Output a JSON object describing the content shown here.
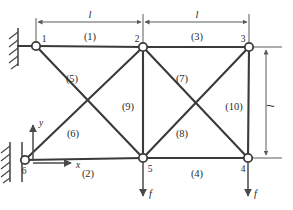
{
  "figure": {
    "stroke_color": "#3a3a3a",
    "thin_color": "#5a5a5a",
    "background": "#ffffff"
  },
  "nodes": [
    {
      "id": "1",
      "label": "1",
      "x": 36,
      "y": 46,
      "label_x": 44,
      "label_y": 42
    },
    {
      "id": "2",
      "label": "2",
      "x": 143,
      "y": 47,
      "label_x": 137,
      "label_y": 42
    },
    {
      "id": "3",
      "label": "3",
      "x": 249,
      "y": 47,
      "label_x": 243,
      "label_y": 42
    },
    {
      "id": "4",
      "label": "4",
      "x": 248,
      "y": 158,
      "label_x": 243,
      "label_y": 172
    },
    {
      "id": "5",
      "label": "5",
      "x": 143,
      "y": 158,
      "label_x": 150,
      "label_y": 172
    },
    {
      "id": "6",
      "label": "6",
      "x": 25,
      "y": 160,
      "label_x": 24,
      "label_y": 174
    }
  ],
  "members": [
    {
      "id": "1",
      "label": "(1)",
      "from": "1",
      "to": "2",
      "label_x": 90,
      "label_y": 40
    },
    {
      "id": "2",
      "label": "(2)",
      "from": "6",
      "to": "5",
      "label_x": 88,
      "label_y": 175
    },
    {
      "id": "3",
      "label": "(3)",
      "from": "2",
      "to": "3",
      "label_x": 197,
      "label_y": 40
    },
    {
      "id": "4",
      "label": "(4)",
      "from": "5",
      "to": "4",
      "label_x": 197,
      "label_y": 175
    },
    {
      "id": "5",
      "label": "(5)",
      "from": "1",
      "to": "5",
      "label_x": 72,
      "label_y": 80
    },
    {
      "id": "6",
      "label": "(6)",
      "from": "6",
      "to": "2",
      "label_x": 73,
      "label_y": 135
    },
    {
      "id": "7",
      "label": "(7)",
      "from": "2",
      "to": "4",
      "label_x": 182,
      "label_y": 80
    },
    {
      "id": "8",
      "label": "(8)",
      "from": "5",
      "to": "3",
      "label_x": 182,
      "label_y": 135
    },
    {
      "id": "9",
      "label": "(9)",
      "from": "2",
      "to": "5",
      "label_x": 128,
      "label_y": 108
    },
    {
      "id": "10",
      "label": "(10)",
      "from": "3",
      "to": "4",
      "label_x": 233,
      "label_y": 108
    }
  ],
  "dimensions": [
    {
      "id": "span-left",
      "label": "l",
      "orientation": "horizontal",
      "from_x": 36,
      "to_x": 143,
      "y": 22,
      "label_x": 90,
      "label_y": 18
    },
    {
      "id": "span-right",
      "label": "l",
      "orientation": "horizontal",
      "from_x": 143,
      "to_x": 249,
      "y": 22,
      "label_x": 197,
      "label_y": 18
    },
    {
      "id": "height",
      "label": "l",
      "orientation": "vertical",
      "x": 266,
      "from_y": 47,
      "to_y": 158,
      "label_x": 274,
      "label_y": 106
    }
  ],
  "supports": [
    {
      "id": "support-top",
      "node": "1",
      "type": "fixed-wall",
      "x": 18,
      "y_top": 28,
      "y_bottom": 66
    },
    {
      "id": "support-bottom",
      "node": "6",
      "type": "fixed-wall",
      "x": 10,
      "y_top": 142,
      "y_bottom": 182
    }
  ],
  "forces": [
    {
      "id": "force-node-5",
      "label": "f",
      "node": "5",
      "direction": "down",
      "x": 143,
      "from_y": 160,
      "to_y": 197,
      "label_x": 149,
      "label_y": 196
    },
    {
      "id": "force-node-4",
      "label": "f",
      "node": "4",
      "direction": "down",
      "x": 248,
      "from_y": 160,
      "to_y": 197,
      "label_x": 254,
      "label_y": 196
    }
  ],
  "axes": {
    "origin_x": 33,
    "origin_y": 163,
    "x_axis": {
      "label": "x",
      "to_x": 72,
      "label_x": 78,
      "label_y": 168
    },
    "y_axis": {
      "label": "y",
      "to_y": 124,
      "label_x": 40,
      "label_y": 124
    }
  }
}
